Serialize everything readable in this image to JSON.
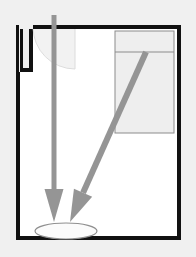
{
  "canvas": {
    "width": 196,
    "height": 257,
    "background_color": "#f0f0f0"
  },
  "diagram": {
    "title": "Vessel cross-section flow diagram",
    "type": "technical-schematic",
    "colors": {
      "page_background": "#f0f0f0",
      "vessel_wall": "#111111",
      "vessel_interior": "#ffffff",
      "arrow_gray": "#959595",
      "inset_box_fill": "#eeeeee",
      "inset_box_stroke": "#8c8c8c",
      "funnel_fill": "#f2f2f2",
      "pool_fill": "#fbfbfb",
      "pool_stroke": "#8f8f8f"
    },
    "vessel": {
      "name": "vessel-outline",
      "left": 16,
      "top": 25,
      "right": 181,
      "bottom": 240,
      "wall_thickness": 4,
      "notch": {
        "name": "inlet-notch",
        "x_left": 19,
        "x_right": 33,
        "depth_y": 72
      }
    },
    "funnel": {
      "name": "funnel-arc",
      "description": "quarter-round hopper lip below top wall",
      "center_x": 75,
      "center_y": 27,
      "radius": 42
    },
    "inset_box": {
      "name": "inset-detail-box",
      "x": 115,
      "y": 31,
      "width": 59,
      "height": 102,
      "divider_y": 52
    },
    "arrows": [
      {
        "name": "vertical-flow-arrow",
        "orientation": "vertical",
        "x_start": 54,
        "y_start": 15,
        "x_end": 54,
        "y_end": 222,
        "shaft_width": 5,
        "head_width": 19,
        "head_length": 33
      },
      {
        "name": "diagonal-flow-arrow",
        "orientation": "diagonal",
        "x_start": 146,
        "y_start": 52,
        "x_end": 70,
        "y_end": 222,
        "shaft_width": 6,
        "head_width": 20,
        "head_length": 32
      }
    ],
    "pool": {
      "name": "liquid-pool-ellipse",
      "center_x": 66,
      "center_y": 231,
      "radius_x": 31,
      "radius_y": 8
    }
  }
}
